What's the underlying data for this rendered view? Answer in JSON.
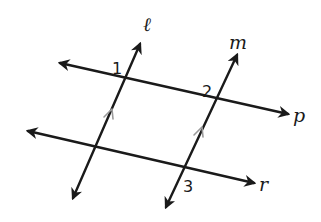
{
  "diagram": {
    "type": "parallel-lines-transversals",
    "colors": {
      "line": "#1a1a1a",
      "tick": "#9a9a9a",
      "background": "#ffffff"
    },
    "lines": [
      {
        "name": "ℓ",
        "label_pos": [
          148,
          30
        ],
        "start": [
          140,
          44
        ],
        "end": [
          73,
          198
        ],
        "role": "transversal",
        "parallel_mark": true
      },
      {
        "name": "m",
        "label_pos": [
          232,
          48
        ],
        "start": [
          237,
          55
        ],
        "end": [
          166,
          207
        ],
        "role": "transversal",
        "parallel_mark": true
      },
      {
        "name": "p",
        "label_pos": [
          293,
          122
        ],
        "start": [
          60,
          63
        ],
        "end": [
          288,
          114
        ],
        "role": "line"
      },
      {
        "name": "r",
        "label_pos": [
          259,
          191
        ],
        "start": [
          28,
          131
        ],
        "end": [
          254,
          183
        ],
        "role": "line"
      }
    ],
    "angles": [
      {
        "label": "1",
        "pos": [
          112,
          73
        ],
        "at": "intersection of ℓ and p"
      },
      {
        "label": "2",
        "pos": [
          202,
          96
        ],
        "at": "intersection of m and p"
      },
      {
        "label": "3",
        "pos": [
          183,
          191
        ],
        "at": "intersection of m and r"
      }
    ],
    "relations": [
      "ℓ ∥ m"
    ]
  }
}
